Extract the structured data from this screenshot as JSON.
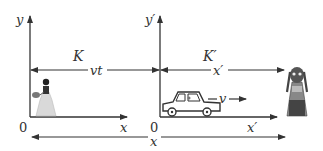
{
  "diagram": {
    "frame_K": {
      "label": "K",
      "y_axis_label": "y",
      "x_axis_label": "x",
      "origin_label": "0"
    },
    "frame_K_prime": {
      "label": "K′",
      "y_axis_label": "y′",
      "x_axis_label": "x′",
      "origin_label": "0"
    },
    "dimensions": {
      "frame_offset_label": "vt",
      "event_in_K_prime_label": "x′",
      "event_in_K_label": "x"
    },
    "moving_object": {
      "icon": "car-icon",
      "velocity_label": "v"
    },
    "observers": [
      {
        "icon": "woman-figure-icon",
        "position": "origin of K"
      },
      {
        "icon": "figure-icon",
        "position": "event location"
      }
    ],
    "colors": {
      "line": "#333333",
      "background": "#ffffff"
    }
  }
}
